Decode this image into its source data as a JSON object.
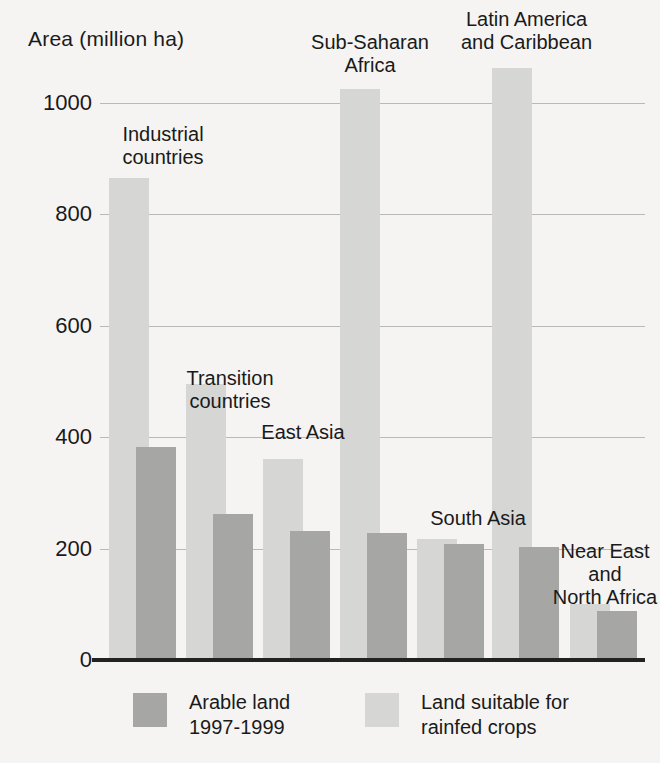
{
  "chart_data": {
    "type": "bar",
    "title": "",
    "ylabel": "Area (million ha)",
    "xlabel": "",
    "ylim": [
      0,
      1100
    ],
    "yticks": [
      0,
      200,
      400,
      600,
      800,
      1000
    ],
    "ytick_labels": [
      "0",
      "200",
      "400",
      "600",
      "800",
      "1000"
    ],
    "grid": true,
    "legend_position": "bottom",
    "categories": [
      "Industrial countries",
      "Transition countries",
      "East Asia",
      "Sub-Saharan Africa",
      "South Asia",
      "Latin America and Caribbean",
      "Near East and North Africa"
    ],
    "series": [
      {
        "name": "Land suitable for rainfed crops",
        "color": "#d6d6d4",
        "values": [
          865,
          495,
          360,
          1025,
          218,
          1063,
          100
        ]
      },
      {
        "name": "Arable land 1997-1999",
        "color": "#a6a6a4",
        "values": [
          383,
          262,
          232,
          228,
          208,
          203,
          88
        ]
      }
    ]
  },
  "axis": {
    "title": "Area (million ha)",
    "ticks": [
      {
        "value": 1000,
        "label": "1000"
      },
      {
        "value": 800,
        "label": "800"
      },
      {
        "value": 600,
        "label": "600"
      },
      {
        "value": 400,
        "label": "400"
      },
      {
        "value": 200,
        "label": "200"
      },
      {
        "value": 0,
        "label": "0"
      }
    ]
  },
  "groups": [
    {
      "key": "industrial",
      "label": "Industrial\ncountries"
    },
    {
      "key": "transition",
      "label": "Transition\ncountries"
    },
    {
      "key": "east-asia",
      "label": "East Asia"
    },
    {
      "key": "sub-saharan",
      "label": "Sub-Saharan\nAfrica"
    },
    {
      "key": "south-asia",
      "label": "South Asia"
    },
    {
      "key": "latin-america",
      "label": "Latin America\nand Caribbean"
    },
    {
      "key": "near-east",
      "label": "Near East\nand\nNorth Africa"
    }
  ],
  "legend": {
    "items": [
      {
        "key": "arable-land",
        "label": "Arable land\n1997-1999",
        "color": "#a6a6a4"
      },
      {
        "key": "land-suitable",
        "label": "Land suitable for\nrainfed crops",
        "color": "#d6d6d4"
      }
    ]
  },
  "colors": {
    "background": "#f5f4f2",
    "light_bar": "#d6d6d4",
    "dark_bar": "#a6a6a4",
    "gridline": "#b9b9b9",
    "baseline": "#222222",
    "text": "#1a1a1a"
  }
}
